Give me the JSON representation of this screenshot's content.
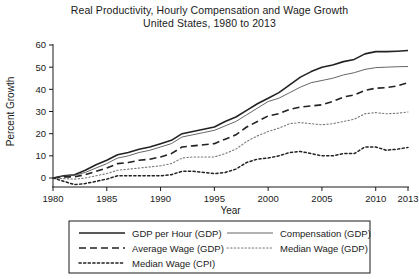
{
  "chart_data": {
    "type": "line",
    "title": "Real Productivity, Hourly Compensation and Wage Growth",
    "subtitle": "United States, 1980 to 2013",
    "xlabel": "Year",
    "ylabel": "Percent Growth",
    "xlim": [
      1980,
      2013
    ],
    "ylim": [
      0,
      60
    ],
    "ytick_labels": [
      "0",
      "10",
      "20",
      "30",
      "40",
      "50",
      "60"
    ],
    "yticks": [
      0,
      10,
      20,
      30,
      40,
      50,
      60
    ],
    "xtick_labels": [
      "1980",
      "1985",
      "1990",
      "1995",
      "2000",
      "2005",
      "2010",
      "2013"
    ],
    "xticks": [
      1980,
      1985,
      1990,
      1995,
      2000,
      2005,
      2010,
      2013
    ],
    "grid": false,
    "legend_position": "below-axes",
    "x": [
      1980,
      1981,
      1982,
      1983,
      1984,
      1985,
      1986,
      1987,
      1988,
      1989,
      1990,
      1991,
      1992,
      1993,
      1994,
      1995,
      1996,
      1997,
      1998,
      1999,
      2000,
      2001,
      2002,
      2003,
      2004,
      2005,
      2006,
      2007,
      2008,
      2009,
      2010,
      2011,
      2012,
      2013
    ],
    "series": [
      {
        "name": "GDP per Hour (GDP)",
        "style": "solid",
        "width": 1.6,
        "color": "#222222",
        "values": [
          0,
          1.0,
          1.5,
          3.5,
          6.0,
          8.0,
          10.5,
          11.5,
          13.0,
          14.0,
          15.5,
          17.0,
          20.0,
          21.0,
          22.0,
          23.0,
          25.5,
          27.5,
          30.5,
          33.5,
          36.0,
          38.5,
          42.0,
          45.5,
          48.0,
          50.0,
          51.0,
          52.5,
          53.5,
          56.0,
          57.0,
          57.0,
          57.2,
          57.5
        ]
      },
      {
        "name": "Compensation (GDP)",
        "style": "solid",
        "width": 0.9,
        "color": "#555555",
        "values": [
          0,
          0.8,
          1.2,
          2.5,
          4.5,
          6.5,
          9.0,
          10.0,
          11.5,
          12.5,
          14.0,
          15.5,
          18.5,
          19.5,
          20.5,
          21.5,
          23.5,
          25.5,
          28.5,
          31.5,
          34.5,
          36.0,
          38.5,
          41.0,
          43.0,
          44.0,
          45.0,
          46.5,
          47.5,
          49.0,
          49.8,
          50.0,
          50.2,
          50.3
        ]
      },
      {
        "name": "Average Wage (GDP)",
        "style": "dashed",
        "width": 1.6,
        "color": "#222222",
        "values": [
          0,
          0.5,
          0.5,
          1.5,
          3.0,
          4.5,
          6.5,
          7.0,
          8.0,
          8.5,
          9.5,
          11.0,
          14.0,
          14.5,
          15.0,
          15.5,
          17.5,
          19.5,
          23.0,
          25.5,
          28.0,
          29.0,
          31.0,
          32.0,
          32.5,
          33.0,
          34.5,
          36.5,
          37.5,
          39.5,
          40.5,
          40.8,
          41.5,
          43.0
        ]
      },
      {
        "name": "Median Wage (GDP)",
        "style": "dotted-fine",
        "width": 1.1,
        "color": "#777777",
        "values": [
          0,
          -0.3,
          -0.5,
          0.0,
          1.0,
          2.0,
          3.5,
          4.0,
          4.5,
          5.0,
          5.5,
          6.5,
          9.0,
          9.5,
          9.5,
          9.5,
          11.0,
          13.0,
          16.5,
          19.0,
          21.0,
          22.5,
          24.5,
          25.0,
          24.5,
          24.0,
          24.5,
          25.5,
          26.5,
          29.0,
          29.5,
          29.0,
          29.2,
          29.8
        ]
      },
      {
        "name": "Median Wage (CPI)",
        "style": "dotted",
        "width": 1.5,
        "color": "#222222",
        "values": [
          0,
          -1.5,
          -3.0,
          -2.5,
          -1.5,
          -0.5,
          1.0,
          1.0,
          1.0,
          1.0,
          1.0,
          1.5,
          3.0,
          3.0,
          2.5,
          2.0,
          2.5,
          4.0,
          7.0,
          8.5,
          9.0,
          10.0,
          11.5,
          12.0,
          11.0,
          10.0,
          10.0,
          11.0,
          11.0,
          14.0,
          14.0,
          12.5,
          13.0,
          13.8
        ]
      }
    ]
  },
  "legend": {
    "entries": [
      {
        "label": "GDP per Hour (GDP)",
        "style": "solid"
      },
      {
        "label": "Compensation (GDP)",
        "style": "solid-thin"
      },
      {
        "label": "Average Wage (GDP)",
        "style": "dashed"
      },
      {
        "label": "Median Wage (GDP)",
        "style": "dotted-fine"
      },
      {
        "label": "Median Wage (CPI)",
        "style": "dotted"
      }
    ]
  }
}
